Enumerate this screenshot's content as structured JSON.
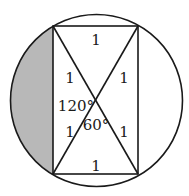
{
  "diagram": {
    "colors": {
      "stroke": "#1a1a1a",
      "shade": "#b8b8b8",
      "background": "#ffffff"
    },
    "circle": {
      "cx": 96.5,
      "cy": 100.5,
      "r": 86
    },
    "rectangle": {
      "top_left": [
        53,
        26
      ],
      "top_right": [
        138,
        26
      ],
      "bottom_right": [
        138,
        174
      ],
      "bottom_left": [
        53,
        174
      ]
    },
    "labels": {
      "top_side": "1",
      "bottom_side": "1",
      "upper_left_half_diagonal": "1",
      "upper_right_half_diagonal": "1",
      "lower_left_half_diagonal": "1",
      "lower_right_half_diagonal": "1",
      "obtuse_angle": "120°",
      "acute_angle": "60°"
    },
    "shaded_region": "segment between left side of rectangle and circle arc"
  }
}
